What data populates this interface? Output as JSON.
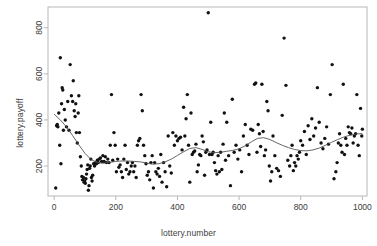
{
  "chart_data": {
    "type": "scatter",
    "title": "",
    "xlabel": "lottery.number",
    "ylabel": "lottery.payoff",
    "xlim": [
      -20,
      1015
    ],
    "ylim": [
      70,
      890
    ],
    "grid": false,
    "legend": null,
    "xticks": [
      0,
      200,
      400,
      600,
      800,
      1000
    ],
    "yticks": [
      200,
      400,
      600,
      800
    ],
    "xtick_labels": [
      "0",
      "200",
      "400",
      "600",
      "800",
      "1000"
    ],
    "ytick_labels": [
      "200",
      "400",
      "600",
      "800"
    ],
    "point_color": "#111111",
    "point_size": 1.7,
    "line_color": "#555555",
    "series": [
      {
        "name": "lottery.payoff",
        "x": [
          5,
          8,
          10,
          12,
          15,
          18,
          20,
          22,
          24,
          26,
          28,
          30,
          33,
          36,
          40,
          44,
          48,
          52,
          56,
          60,
          62,
          65,
          68,
          70,
          72,
          75,
          78,
          80,
          82,
          85,
          88,
          90,
          92,
          95,
          97,
          99,
          101,
          103,
          105,
          107,
          109,
          111,
          113,
          115,
          117,
          119,
          121,
          123,
          125,
          128,
          131,
          134,
          137,
          140,
          143,
          146,
          150,
          154,
          158,
          162,
          166,
          170,
          174,
          178,
          182,
          186,
          190,
          194,
          198,
          202,
          206,
          210,
          214,
          218,
          222,
          226,
          230,
          234,
          238,
          242,
          246,
          250,
          254,
          258,
          262,
          266,
          270,
          274,
          278,
          282,
          286,
          290,
          294,
          298,
          302,
          306,
          310,
          314,
          318,
          322,
          326,
          330,
          334,
          338,
          342,
          346,
          350,
          355,
          360,
          365,
          370,
          375,
          380,
          385,
          390,
          395,
          400,
          405,
          410,
          415,
          420,
          424,
          428,
          432,
          436,
          440,
          444,
          448,
          452,
          456,
          460,
          464,
          468,
          472,
          476,
          480,
          484,
          488,
          492,
          496,
          500,
          504,
          508,
          512,
          516,
          520,
          524,
          528,
          532,
          536,
          540,
          544,
          548,
          552,
          556,
          560,
          566,
          572,
          578,
          584,
          590,
          596,
          602,
          608,
          614,
          620,
          626,
          632,
          638,
          644,
          650,
          654,
          658,
          662,
          666,
          670,
          674,
          678,
          682,
          686,
          690,
          694,
          698,
          702,
          706,
          710,
          716,
          722,
          728,
          734,
          740,
          746,
          752,
          758,
          764,
          768,
          772,
          776,
          780,
          784,
          788,
          792,
          796,
          800,
          806,
          812,
          818,
          824,
          830,
          836,
          842,
          848,
          854,
          860,
          866,
          872,
          878,
          884,
          890,
          896,
          902,
          908,
          914,
          918,
          922,
          926,
          930,
          934,
          938,
          942,
          946,
          950,
          954,
          958,
          962,
          966,
          970,
          974,
          978,
          982,
          986,
          990,
          994,
          998,
          1000
        ],
        "y": [
          105,
          375,
          380,
          370,
          430,
          290,
          670,
          210,
          470,
          540,
          530,
          355,
          445,
          400,
          370,
          480,
          355,
          640,
          505,
          480,
          570,
          440,
          415,
          470,
          345,
          300,
          430,
          505,
          345,
          240,
          200,
          155,
          140,
          150,
          130,
          135,
          125,
          145,
          165,
          185,
          205,
          95,
          115,
          190,
          200,
          230,
          150,
          135,
          160,
          210,
          200,
          215,
          210,
          225,
          215,
          230,
          235,
          220,
          245,
          220,
          240,
          215,
          230,
          215,
          290,
          510,
          225,
          345,
          290,
          175,
          230,
          195,
          205,
          175,
          150,
          230,
          290,
          185,
          215,
          165,
          175,
          200,
          215,
          175,
          200,
          150,
          290,
          310,
          320,
          510,
          440,
          290,
          245,
          210,
          160,
          175,
          140,
          215,
          245,
          105,
          215,
          175,
          165,
          190,
          155,
          250,
          130,
          215,
          175,
          110,
          330,
          200,
          170,
          345,
          290,
          330,
          310,
          320,
          325,
          270,
          455,
          330,
          405,
          510,
          290,
          130,
          430,
          250,
          260,
          265,
          295,
          175,
          205,
          250,
          245,
          330,
          305,
          160,
          260,
          270,
          865,
          250,
          390,
          250,
          260,
          215,
          180,
          165,
          245,
          175,
          260,
          185,
          295,
          430,
          225,
          390,
          245,
          115,
          490,
          260,
          290,
          230,
          270,
          175,
          330,
          380,
          290,
          250,
          360,
          355,
          555,
          560,
          260,
          380,
          340,
          285,
          555,
          350,
          245,
          270,
          480,
          440,
          200,
          135,
          175,
          330,
          245,
          190,
          180,
          155,
          420,
          755,
          550,
          225,
          200,
          245,
          290,
          180,
          215,
          200,
          245,
          230,
          260,
          310,
          290,
          350,
          250,
          375,
          315,
          405,
          330,
          365,
          540,
          390,
          300,
          275,
          320,
          370,
          295,
          510,
          640,
          145,
          175,
          215,
          300,
          340,
          290,
          260,
          555,
          250,
          320,
          290,
          370,
          345,
          340,
          365,
          300,
          330,
          340,
          510,
          290,
          245,
          450,
          330,
          360
        ]
      }
    ],
    "smoother": {
      "name": "loess",
      "x": [
        0,
        20,
        40,
        60,
        80,
        100,
        120,
        140,
        160,
        180,
        200,
        220,
        240,
        260,
        280,
        300,
        320,
        340,
        360,
        380,
        400,
        420,
        440,
        460,
        480,
        500,
        520,
        540,
        560,
        580,
        600,
        620,
        640,
        660,
        680,
        700,
        720,
        740,
        760,
        780,
        800,
        820,
        840,
        860,
        880,
        900,
        920,
        940,
        960,
        980,
        1000
      ],
      "y": [
        425,
        400,
        370,
        332,
        292,
        255,
        228,
        215,
        212,
        216,
        220,
        222,
        222,
        220,
        218,
        213,
        208,
        210,
        218,
        230,
        246,
        262,
        276,
        280,
        272,
        262,
        258,
        260,
        264,
        268,
        275,
        288,
        305,
        320,
        323,
        315,
        302,
        290,
        280,
        272,
        267,
        266,
        270,
        278,
        290,
        303,
        315,
        326,
        334,
        339,
        341
      ]
    }
  }
}
